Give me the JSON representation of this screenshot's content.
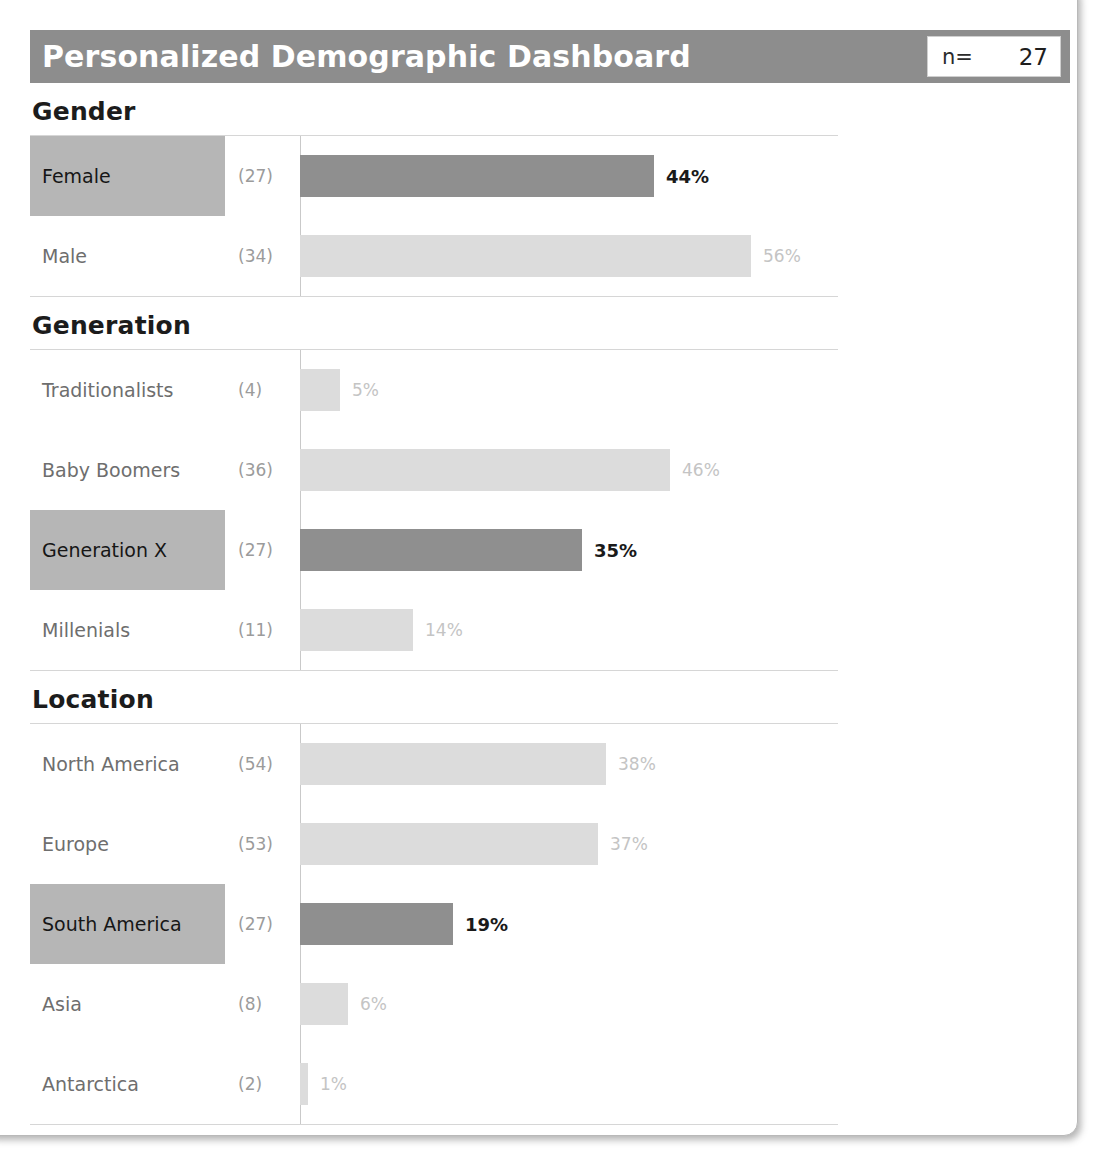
{
  "header": {
    "title": "Personalized Demographic Dashboard",
    "n_label": "n=",
    "n_value": "27",
    "bar_color": "#8d8d8d",
    "title_color": "#ffffff"
  },
  "colors": {
    "selected_bar": "#8f8f8f",
    "unselected_bar": "#dcdcdc",
    "selected_label_bg": "#b6b6b6",
    "label_text": "#6e6e6e",
    "count_text": "#9b9b9b",
    "axis_line": "#c9c9c9",
    "row_divider": "#d6d6d6"
  },
  "sections": [
    {
      "title": "Gender",
      "rows": [
        {
          "label": "Female",
          "count": "(27)",
          "value": "44%",
          "percent": 44,
          "selected": true
        },
        {
          "label": "Male",
          "count": "(34)",
          "value": "56%",
          "percent": 56,
          "selected": false
        }
      ]
    },
    {
      "title": "Generation",
      "rows": [
        {
          "label": "Traditionalists",
          "count": "(4)",
          "value": "5%",
          "percent": 5,
          "selected": false
        },
        {
          "label": "Baby Boomers",
          "count": "(36)",
          "value": "46%",
          "percent": 46,
          "selected": false
        },
        {
          "label": "Generation X",
          "count": "(27)",
          "value": "35%",
          "percent": 35,
          "selected": true
        },
        {
          "label": "Millenials",
          "count": "(11)",
          "value": "14%",
          "percent": 14,
          "selected": false
        }
      ]
    },
    {
      "title": "Location",
      "rows": [
        {
          "label": "North America",
          "count": "(54)",
          "value": "38%",
          "percent": 38,
          "selected": false
        },
        {
          "label": "Europe",
          "count": "(53)",
          "value": "37%",
          "percent": 37,
          "selected": false
        },
        {
          "label": "South America",
          "count": "(27)",
          "value": "19%",
          "percent": 19,
          "selected": true
        },
        {
          "label": "Asia",
          "count": "(8)",
          "value": "6%",
          "percent": 6,
          "selected": false
        },
        {
          "label": "Antarctica",
          "count": "(2)",
          "value": "1%",
          "percent": 1,
          "selected": false
        }
      ]
    }
  ],
  "chart_data": {
    "type": "bar",
    "title": "Personalized Demographic Dashboard",
    "orientation": "horizontal",
    "xlabel": "",
    "ylabel": "",
    "xlim": [
      0,
      56
    ],
    "grid": false,
    "legend": null,
    "annotations": [
      "n= 27"
    ],
    "panels": [
      {
        "name": "Gender",
        "categories": [
          "Female",
          "Male"
        ],
        "values": [
          44,
          56
        ],
        "counts": [
          27,
          34
        ],
        "highlighted": [
          "Female"
        ]
      },
      {
        "name": "Generation",
        "categories": [
          "Traditionalists",
          "Baby Boomers",
          "Generation X",
          "Millenials"
        ],
        "values": [
          5,
          46,
          35,
          14
        ],
        "counts": [
          4,
          36,
          27,
          11
        ],
        "highlighted": [
          "Generation X"
        ]
      },
      {
        "name": "Location",
        "categories": [
          "North America",
          "Europe",
          "South America",
          "Asia",
          "Antarctica"
        ],
        "values": [
          38,
          37,
          19,
          6,
          1
        ],
        "counts": [
          54,
          53,
          27,
          8,
          2
        ],
        "highlighted": [
          "South America"
        ]
      }
    ]
  },
  "scale": {
    "px_per_percent": 8.05
  }
}
